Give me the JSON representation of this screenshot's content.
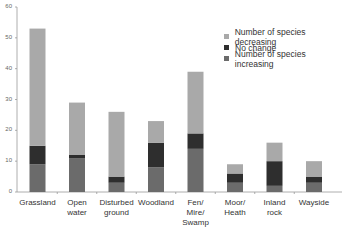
{
  "chart_data": {
    "type": "bar",
    "stacked": true,
    "title": "",
    "xlabel": "",
    "ylabel": "",
    "ylim": [
      0,
      60
    ],
    "yticks": [
      0,
      10,
      20,
      30,
      40,
      50,
      60
    ],
    "grid": false,
    "legend_position": "top-right",
    "categories": [
      "Grassland",
      "Open water",
      "Disturbed ground",
      "Woodland",
      "Fen/ Mire/ Swamp",
      "Moor/ Heath",
      "Inland rock",
      "Wayside"
    ],
    "category_lines": [
      [
        "Grassland"
      ],
      [
        "Open",
        "water"
      ],
      [
        "Disturbed",
        "ground"
      ],
      [
        "Woodland"
      ],
      [
        "Fen/",
        "Mire/",
        "Swamp"
      ],
      [
        "Moor/",
        "Heath"
      ],
      [
        "Inland",
        "rock"
      ],
      [
        "Wayside"
      ]
    ],
    "series": [
      {
        "name": "Number of species increasing",
        "color": "#6b6b6b",
        "values": [
          9,
          11,
          3,
          8,
          14,
          3,
          2,
          3
        ]
      },
      {
        "name": "No change",
        "color": "#2e2e2e",
        "values": [
          6,
          1,
          2,
          8,
          5,
          3,
          8,
          2
        ]
      },
      {
        "name": "Number of species decreasing",
        "color": "#a9a9a9",
        "values": [
          38,
          17,
          21,
          7,
          20,
          3,
          6,
          5
        ]
      }
    ],
    "legend": [
      "Number of species decreasing",
      "No change",
      "Number of species increasing"
    ]
  }
}
